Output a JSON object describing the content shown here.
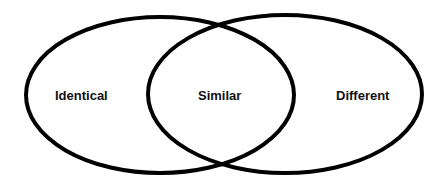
{
  "diagram": {
    "type": "venn",
    "stroke_color": "#000000",
    "background": "#ffffff",
    "sets": [
      {
        "name": "left-set",
        "cx": 160,
        "cy": 95,
        "rx": 134,
        "ry": 78
      },
      {
        "name": "right-set",
        "cx": 285,
        "cy": 94,
        "rx": 137,
        "ry": 79
      }
    ],
    "regions": {
      "left_only": "Identical",
      "overlap": "Similar",
      "right_only": "Different"
    }
  }
}
